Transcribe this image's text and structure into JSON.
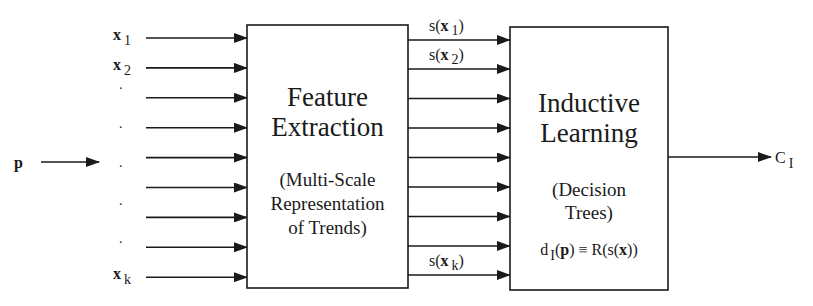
{
  "diagram": {
    "input_label": {
      "base": "p",
      "bold": true
    },
    "input_vectors": [
      {
        "base": "x",
        "sub": "1"
      },
      {
        "base": "x",
        "sub": "2"
      },
      {
        "base": ".",
        "sub": ""
      },
      {
        "base": ".",
        "sub": ""
      },
      {
        "base": ".",
        "sub": ""
      },
      {
        "base": "",
        "sub": ""
      },
      {
        "base": ".",
        "sub": ""
      },
      {
        "base": ".",
        "sub": ""
      },
      {
        "base": "x",
        "sub": "k"
      }
    ],
    "feature_box": {
      "title_lines": [
        "Feature",
        "Extraction"
      ],
      "subtitle_lines": [
        "(Multi-Scale",
        "Representation",
        "of Trends)"
      ]
    },
    "feature_outputs": [
      {
        "prefix": "s(",
        "base": "x",
        "sub": "1",
        "suffix": ")"
      },
      {
        "prefix": "s(",
        "base": "x",
        "sub": "2",
        "suffix": ")"
      },
      null,
      null,
      null,
      null,
      null,
      null,
      {
        "prefix": "s(",
        "base": "x",
        "sub": "k",
        "suffix": ")"
      }
    ],
    "learning_box": {
      "title_lines": [
        "Inductive",
        "Learning"
      ],
      "subtitle_lines": [
        "(Decision",
        "Trees)"
      ],
      "formula": {
        "d": "d",
        "d_sub": "I",
        "open": "(",
        "p": "p",
        "mid": ") ≡ R(s(",
        "x": "x",
        "close": "))"
      }
    },
    "output_label": {
      "base": "C",
      "sub": "I"
    }
  }
}
